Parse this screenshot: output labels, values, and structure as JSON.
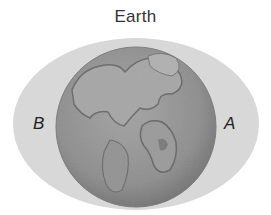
{
  "diagram": {
    "title": "Earth",
    "labels": {
      "left": "B",
      "right": "A"
    },
    "elements": {
      "bulge": {
        "shape": "ellipse",
        "color": "#d6d6d6",
        "description": "tidal bulge surrounding Earth"
      },
      "planet": {
        "shape": "circle",
        "color": "#8c8c8c",
        "description": "Earth globe"
      }
    }
  }
}
